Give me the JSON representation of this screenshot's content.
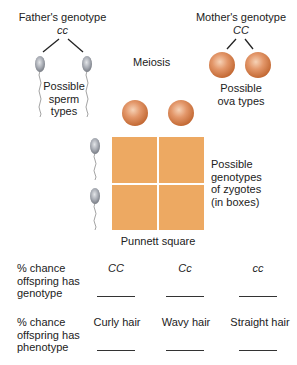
{
  "father": {
    "title": "Father's genotype",
    "genotype": "cc",
    "gametes_label_line1": "Possible",
    "gametes_label_line2": "sperm",
    "gametes_label_line3": "types"
  },
  "mother": {
    "title": "Mother's genotype",
    "genotype": "CC",
    "gametes_label_line1": "Possible",
    "gametes_label_line2": "ova types"
  },
  "process_label": "Meiosis",
  "punnett": {
    "caption": "Punnett square",
    "side_label_lines": [
      "Possible",
      "genotypes",
      "of zygotes",
      "(in boxes)"
    ],
    "cells": [
      "",
      "",
      "",
      ""
    ]
  },
  "colors": {
    "ovum": "#d9834f",
    "ovum_highlight": "#f6d2b6",
    "sperm_head": "#9a9ea6",
    "sperm_highlight": "#dfe1e5",
    "punnett_cell": "#eda962",
    "line": "#222222"
  },
  "table": {
    "genotype_row": {
      "label_lines": [
        "% chance",
        "offspring has",
        "genotype"
      ],
      "columns": [
        "CC",
        "Cc",
        "cc"
      ],
      "answers": [
        "",
        "",
        ""
      ]
    },
    "phenotype_row": {
      "label_lines": [
        "% chance",
        "offspring has",
        "phenotype"
      ],
      "columns": [
        "Curly hair",
        "Wavy hair",
        "Straight hair"
      ],
      "answers": [
        "",
        "",
        ""
      ]
    }
  }
}
